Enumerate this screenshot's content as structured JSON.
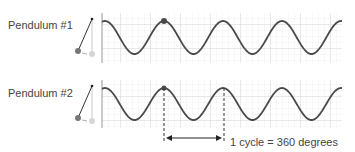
{
  "pendulum1": {
    "label": "Pendulum #1"
  },
  "pendulum2": {
    "label": "Pendulum #2"
  },
  "annotation": {
    "text": "1 cycle = 360 degrees"
  },
  "colors": {
    "wave": "#4a4a4a",
    "grid_minor": "#e4e4e4",
    "grid_major": "#cfcfcf",
    "border": "#bbbbbb",
    "dot": "#4a4a4a",
    "ghost_dot": "#cccccc",
    "text": "#444444"
  },
  "chart_data": [
    {
      "type": "line",
      "title": "Pendulum #1",
      "series": [
        {
          "name": "displacement",
          "shape": "cosine",
          "period_px": 59,
          "marked_peak_x": 164
        }
      ],
      "grid": true
    },
    {
      "type": "line",
      "title": "Pendulum #2",
      "series": [
        {
          "name": "displacement",
          "shape": "cosine",
          "period_px": 59,
          "marked_peak_x": 164
        }
      ],
      "grid": true,
      "annotation": "1 cycle = 360 degrees"
    }
  ]
}
